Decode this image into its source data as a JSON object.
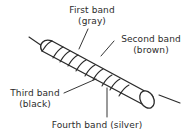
{
  "figure": {
    "background_color": "#ffffff",
    "line_color": "#2b2b2b",
    "body_fill": "#ffffff",
    "width": 186,
    "height": 136
  },
  "labels": {
    "first": {
      "name": "First band",
      "value": "(gray)"
    },
    "second": {
      "name": "Second band",
      "value": "(brown)"
    },
    "third": {
      "name": "Third band",
      "value": "(black)"
    },
    "fourth": {
      "name": "Fourth band (silver)",
      "value": ""
    }
  },
  "component": {
    "type": "resistor",
    "band_count": 4,
    "band_colors": [
      "gray",
      "brown",
      "black",
      "silver"
    ],
    "leads": 2
  }
}
